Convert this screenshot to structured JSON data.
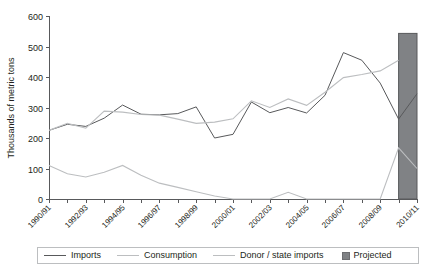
{
  "chart_data": {
    "type": "line",
    "title": "",
    "subtitle": "",
    "xlabel": "",
    "ylabel": "Thousands of metric tons",
    "ylim": [
      0,
      600
    ],
    "ytick_step": 100,
    "ytick_labels": [
      "0",
      "100",
      "200",
      "300",
      "400",
      "500",
      "600"
    ],
    "grid": false,
    "legend_position": "bottom",
    "categories": [
      "1990/91",
      "1991/92",
      "1992/93",
      "1993/94",
      "1994/95",
      "1995/96",
      "1996/97",
      "1997/98",
      "1998/99",
      "1999/00",
      "2000/01",
      "2001/02",
      "2002/03",
      "2003/04",
      "2004/05",
      "2005/06",
      "2006/07",
      "2007/08",
      "2008/09",
      "2009/10",
      "2010/11"
    ],
    "xtick_labels_shown": [
      "1990/91",
      "1992/93",
      "1994/95",
      "1996/97",
      "1998/99",
      "2000/01",
      "2002/03",
      "2004/05",
      "2006/07",
      "2008/09",
      "2010/11"
    ],
    "series": [
      {
        "name": "Imports",
        "color": "#58595b",
        "values": [
          225,
          245,
          238,
          265,
          308,
          278,
          276,
          280,
          302,
          200,
          212,
          318,
          283,
          300,
          282,
          340,
          480,
          455,
          380,
          262,
          345
        ]
      },
      {
        "name": "Consumption",
        "color": "#bcbec0",
        "values": [
          225,
          248,
          232,
          288,
          285,
          277,
          275,
          262,
          248,
          252,
          263,
          322,
          300,
          328,
          307,
          350,
          398,
          408,
          420,
          455,
          null
        ]
      },
      {
        "name": "Donor / state imports",
        "color": "#bcbec0",
        "values": [
          110,
          83,
          72,
          88,
          110,
          78,
          52,
          38,
          24,
          10,
          0,
          0,
          0,
          22,
          0,
          0,
          0,
          0,
          0,
          168,
          100
        ]
      }
    ],
    "annotations": [
      {
        "kind": "shaded-band",
        "label": "Projected",
        "color": "#808285",
        "start_category": "2009/10",
        "end_category": "2010/11",
        "top_value": 543
      }
    ],
    "legend": [
      {
        "label": "Imports",
        "marker": "line",
        "color": "#58595b"
      },
      {
        "label": "Consumption",
        "marker": "line",
        "color": "#bcbec0"
      },
      {
        "label": "Donor / state imports",
        "marker": "line",
        "color": "#bcbec0"
      },
      {
        "label": "Projected",
        "marker": "box",
        "color": "#808285"
      }
    ]
  }
}
